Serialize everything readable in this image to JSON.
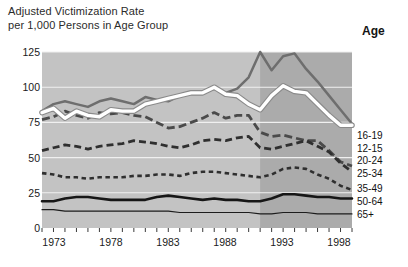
{
  "title": {
    "line1": "Adjusted Victimization Rate",
    "line2": "per 1,000 Persons in Age Group"
  },
  "legend": {
    "header": "Age",
    "items": [
      {
        "label": "16-19"
      },
      {
        "label": "12-15"
      },
      {
        "label": "20-24"
      },
      {
        "label": "25-34"
      },
      {
        "label": "35-49"
      },
      {
        "label": "50-64"
      },
      {
        "label": "65+"
      }
    ]
  },
  "axis": {
    "y_ticks": [
      "0",
      "25",
      "50",
      "75",
      "100",
      "125"
    ],
    "x_ticks": [
      "1973",
      "1978",
      "1983",
      "1988",
      "1993",
      "1998"
    ]
  },
  "colors": {
    "plot_background_light": "#c3c3c3",
    "plot_background_dark": "#ababab",
    "gridline": "#f0f0f0",
    "series_16_19": "#ffffff",
    "series_12_15": "#6e6e6e",
    "series_20_24": "#4a4a4a",
    "series_25_34": "#2f2f2f",
    "series_35_49": "#161616",
    "series_50_64": "#1c1c1c",
    "series_65_plus": "#1c1c1c",
    "text": "#1a1a1a"
  },
  "chart_data": {
    "type": "line",
    "title": "Adjusted Victimization Rate per 1,000 Persons in Age Group",
    "xlabel": "",
    "ylabel": "Adjusted Victimization Rate per 1,000 Persons in Age Group",
    "xlim": [
      1973,
      2000
    ],
    "ylim": [
      0,
      125
    ],
    "grid": true,
    "legend_position": "right",
    "x": [
      1973,
      1974,
      1975,
      1976,
      1977,
      1978,
      1979,
      1980,
      1981,
      1982,
      1983,
      1984,
      1985,
      1986,
      1987,
      1988,
      1989,
      1990,
      1991,
      1992,
      1993,
      1994,
      1995,
      1996,
      1997,
      1998,
      1999,
      2000
    ],
    "shaded_region": {
      "from": 1992,
      "to": 2000,
      "note": "darker background band"
    },
    "series": [
      {
        "name": "16-19",
        "style": "solid-white-thick",
        "color": "#ffffff",
        "values": [
          82,
          85,
          78,
          83,
          80,
          79,
          84,
          83,
          83,
          88,
          90,
          92,
          94,
          96,
          96,
          100,
          95,
          94,
          88,
          84,
          94,
          101,
          97,
          96,
          88,
          80,
          73,
          73
        ]
      },
      {
        "name": "12-15",
        "style": "solid-gray",
        "color": "#6e6e6e",
        "values": [
          83,
          88,
          90,
          88,
          86,
          90,
          92,
          90,
          88,
          93,
          91,
          90,
          94,
          96,
          96,
          99,
          96,
          99,
          107,
          125,
          112,
          122,
          124,
          113,
          104,
          94,
          84,
          74
        ]
      },
      {
        "name": "20-24",
        "style": "long-dash",
        "color": "#4a4a4a",
        "values": [
          77,
          79,
          83,
          80,
          78,
          82,
          81,
          82,
          80,
          79,
          75,
          71,
          72,
          75,
          78,
          82,
          78,
          80,
          80,
          68,
          65,
          66,
          64,
          62,
          62,
          55,
          47,
          44
        ]
      },
      {
        "name": "25-34",
        "style": "medium-dash",
        "color": "#2f2f2f",
        "values": [
          55,
          57,
          59,
          58,
          56,
          58,
          59,
          60,
          62,
          61,
          60,
          58,
          57,
          59,
          62,
          63,
          62,
          64,
          65,
          57,
          56,
          58,
          60,
          62,
          58,
          54,
          46,
          40
        ]
      },
      {
        "name": "35-49",
        "style": "short-dash",
        "color": "#2f2f2f",
        "values": [
          39,
          38,
          36,
          36,
          35,
          36,
          36,
          36,
          37,
          37,
          38,
          38,
          37,
          39,
          40,
          40,
          39,
          38,
          37,
          36,
          38,
          42,
          43,
          42,
          38,
          35,
          30,
          27
        ]
      },
      {
        "name": "50-64",
        "style": "solid-thick-black",
        "color": "#161616",
        "values": [
          19,
          19,
          21,
          22,
          22,
          21,
          20,
          20,
          20,
          20,
          22,
          23,
          22,
          21,
          20,
          21,
          20,
          20,
          19,
          19,
          21,
          24,
          24,
          23,
          22,
          22,
          21,
          21
        ]
      },
      {
        "name": "65+",
        "style": "solid-thin-black",
        "color": "#1c1c1c",
        "values": [
          13,
          13,
          12,
          12,
          12,
          12,
          12,
          12,
          12,
          12,
          12,
          12,
          11,
          11,
          11,
          11,
          11,
          11,
          11,
          10,
          10,
          11,
          11,
          11,
          10,
          10,
          10,
          10
        ]
      }
    ]
  }
}
